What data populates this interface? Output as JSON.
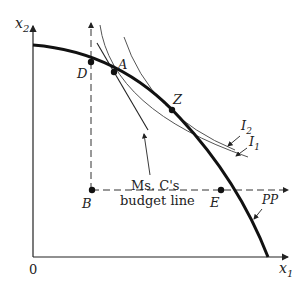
{
  "diagram": {
    "axes": {
      "y_label": "x",
      "y_sub": "2",
      "x_label": "x",
      "x_sub": "1",
      "origin": "0"
    },
    "points": {
      "A": "A",
      "B": "B",
      "D": "D",
      "E": "E",
      "Z": "Z"
    },
    "curves": {
      "ppf": "PP",
      "i1": "I",
      "i1_sub": "1",
      "i2": "I",
      "i2_sub": "2"
    },
    "budget_label_line1": "Ms. C's",
    "budget_label_line2": "budget line",
    "colors": {
      "ink": "#111111",
      "thin": "#555555"
    }
  }
}
